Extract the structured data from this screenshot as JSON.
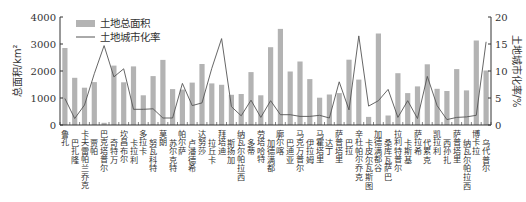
{
  "chart_data": {
    "type": "bar+line",
    "title": "",
    "legend": {
      "position": "top-left-inside",
      "entries": [
        {
          "label": "土地总面积",
          "kind": "bar",
          "color": "#b3b3b3"
        },
        {
          "label": "土地城市化率",
          "kind": "line",
          "color": "#555555"
        }
      ]
    },
    "xlabel": "",
    "ylabel_left": "总面积/km²",
    "ylabel_right": "土地城市化率/%",
    "ylim_left": [
      0,
      4000
    ],
    "yticks_left": [
      0,
      1000,
      2000,
      3000,
      4000
    ],
    "ylim_right": [
      0,
      20
    ],
    "yticks_right": [
      0,
      5,
      10,
      15,
      20
    ],
    "grid": false,
    "categories": [
      "鲁孔",
      "巴扎隆",
      "卡夫雷帕兰乔克",
      "贾帕",
      "巴克塔普尔",
      "奇特万",
      "坎昌布尔",
      "卡拉利",
      "多拉卡",
      "努瓦科特",
      "莫朗",
      "苏尔克特",
      "帕尔萨",
      "卢潘德希",
      "达努莎",
      "拉丘卡",
      "拜塔迪",
      "斯扬加",
      "纳瓦尔帕拉西",
      "多蒂",
      "劳塔哈特",
      "加德满都",
      "廓尔喀",
      "巴迪亚",
      "马克万普尔",
      "伊拉姆",
      "马霍塔里",
      "达丁",
      "萨普塔里",
      "巴拉",
      "辛杜帕尔乔克",
      "卡皮尔瓦斯图",
      "加德满都谷",
      "桑库瓦萨巴",
      "拉利特普尔",
      "卡斯基",
      "萨拉希",
      "代累克",
      "凯拉利",
      "西孙扎",
      "萨普塔里",
      "纳瓦尔帕拉西",
      "博卡拉",
      "乌代普尔"
    ],
    "series": [
      {
        "name": "土地总面积",
        "type": "bar",
        "axis": "left",
        "unit": "km²",
        "values": [
          2850,
          1750,
          1380,
          1590,
          80,
          2200,
          1580,
          2170,
          1100,
          1810,
          2410,
          1330,
          1310,
          1570,
          2260,
          1540,
          1490,
          1120,
          1150,
          1960,
          1100,
          2880,
          3560,
          1980,
          2350,
          1700,
          1010,
          1130,
          1180,
          2420,
          1680,
          300,
          3390,
          350,
          1920,
          1180,
          1430,
          2250,
          1340,
          1260,
          2070,
          1280,
          3130,
          2020
        ]
      },
      {
        "name": "土地城市化率",
        "type": "line",
        "axis": "right",
        "unit": "%",
        "values": [
          4.9,
          1.2,
          3.7,
          9.5,
          14.7,
          8.9,
          10.4,
          2.9,
          2.9,
          3.0,
          1.3,
          1.3,
          7.7,
          3.6,
          4.1,
          10.5,
          16.0,
          3.4,
          1.7,
          4.6,
          1.4,
          4.5,
          1.9,
          1.9,
          1.6,
          1.6,
          1.8,
          1.3,
          8.0,
          2.8,
          16.5,
          3.5,
          4.5,
          6.6,
          1.4,
          4.5,
          1.2,
          9.0,
          3.6,
          1.0,
          1.4,
          1.5,
          1.8,
          15.4
        ]
      }
    ]
  }
}
